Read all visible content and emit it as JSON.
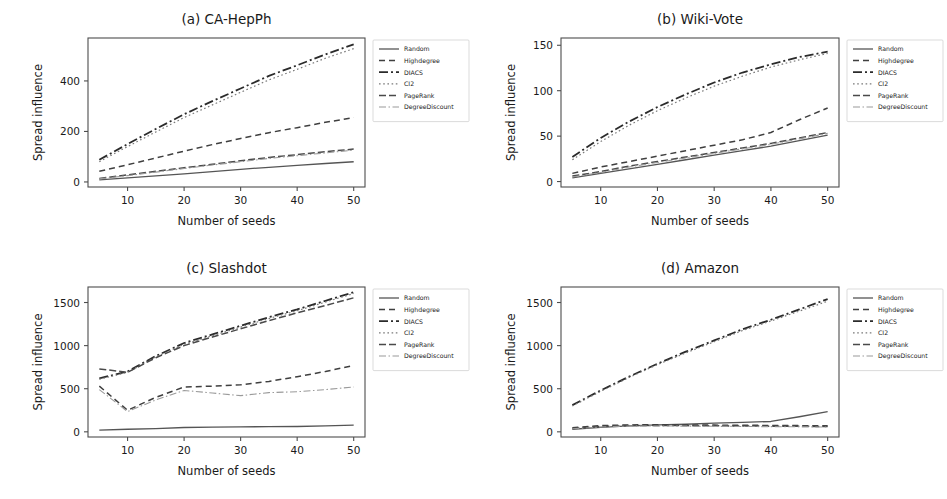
{
  "figure": {
    "background": "#ffffff",
    "axis_color": "#4d4d4d",
    "text_color": "#1a1a1a"
  },
  "series_styles": [
    {
      "key": "random",
      "label": "Random",
      "color": "#555555",
      "width": 1.3,
      "dash": "none"
    },
    {
      "key": "highdegree",
      "label": "Highdegree",
      "color": "#3f3f3f",
      "width": 1.5,
      "dash": "6,4"
    },
    {
      "key": "diacs",
      "label": "DIACS",
      "color": "#2b2b2b",
      "width": 1.8,
      "dash": "9,3,2,3"
    },
    {
      "key": "ci2",
      "label": "CI2",
      "color": "#7a7a7a",
      "width": 1.2,
      "dash": "1.6,2.6"
    },
    {
      "key": "pagerank",
      "label": "PageRank",
      "color": "#4a4a4a",
      "width": 1.5,
      "dash": "7,3"
    },
    {
      "key": "degreediscount",
      "label": "DegreeDiscount",
      "color": "#9a9a9a",
      "width": 1.1,
      "dash": "7,2.5,1.5,2.5"
    }
  ],
  "common": {
    "xlabel": "Number of seeds",
    "ylabel": "Spread influence",
    "xticks": [
      10,
      20,
      30,
      40,
      50
    ],
    "xlim": [
      3,
      52
    ],
    "legend_position": "right-outside",
    "grid": false
  },
  "chart_data": [
    {
      "type": "line",
      "panel": "a",
      "title": "(a) CA-HepPh",
      "xlabel": "Number of seeds",
      "ylabel": "Spread influence",
      "x": [
        5,
        10,
        15,
        20,
        25,
        30,
        35,
        40,
        45,
        50
      ],
      "xticks": [
        10,
        20,
        30,
        40,
        50
      ],
      "yticks": [
        0,
        200,
        400
      ],
      "xlim": [
        3,
        52
      ],
      "ylim": [
        -20,
        570
      ],
      "series": [
        {
          "name": "Random",
          "values": [
            8,
            16,
            24,
            32,
            41,
            50,
            58,
            66,
            73,
            80
          ]
        },
        {
          "name": "Highdegree",
          "values": [
            42,
            68,
            95,
            122,
            148,
            172,
            195,
            215,
            236,
            255
          ]
        },
        {
          "name": "DIACS",
          "values": [
            88,
            150,
            210,
            268,
            320,
            370,
            420,
            462,
            505,
            545
          ]
        },
        {
          "name": "CI2",
          "values": [
            80,
            140,
            198,
            255,
            305,
            355,
            404,
            446,
            490,
            528
          ]
        },
        {
          "name": "PageRank",
          "values": [
            14,
            28,
            42,
            56,
            70,
            84,
            97,
            108,
            120,
            130
          ]
        },
        {
          "name": "DegreeDiscount",
          "values": [
            12,
            25,
            39,
            53,
            67,
            80,
            93,
            104,
            115,
            126
          ]
        }
      ]
    },
    {
      "type": "line",
      "panel": "b",
      "title": "(b) Wiki-Vote",
      "xlabel": "Number of seeds",
      "ylabel": "Spread influence",
      "x": [
        5,
        10,
        15,
        20,
        25,
        30,
        35,
        40,
        45,
        50
      ],
      "xticks": [
        10,
        20,
        30,
        40,
        50
      ],
      "yticks": [
        0,
        50,
        100,
        150
      ],
      "xlim": [
        3,
        52
      ],
      "ylim": [
        -6,
        158
      ],
      "series": [
        {
          "name": "Random",
          "values": [
            4,
            9,
            14,
            19,
            24,
            29,
            34,
            39,
            45,
            51
          ]
        },
        {
          "name": "Highdegree",
          "values": [
            9,
            16,
            22,
            28,
            34,
            40,
            46,
            54,
            68,
            81
          ]
        },
        {
          "name": "DIACS",
          "values": [
            27,
            48,
            66,
            82,
            96,
            109,
            120,
            129,
            137,
            143
          ]
        },
        {
          "name": "CI2",
          "values": [
            24,
            44,
            62,
            78,
            92,
            105,
            116,
            126,
            134,
            141
          ]
        },
        {
          "name": "PageRank",
          "values": [
            6,
            11,
            17,
            22,
            27,
            32,
            37,
            42,
            48,
            54
          ]
        },
        {
          "name": "DegreeDiscount",
          "values": [
            5,
            10,
            16,
            21,
            26,
            31,
            36,
            41,
            47,
            53
          ]
        }
      ]
    },
    {
      "type": "line",
      "panel": "c",
      "title": "(c) Slashdot",
      "xlabel": "Number of seeds",
      "ylabel": "Spread influence",
      "x": [
        5,
        10,
        15,
        20,
        25,
        30,
        35,
        40,
        45,
        50
      ],
      "xticks": [
        10,
        20,
        30,
        40,
        50
      ],
      "yticks": [
        0,
        500,
        1000,
        1500
      ],
      "xlim": [
        3,
        52
      ],
      "ylim": [
        -60,
        1680
      ],
      "series": [
        {
          "name": "Random",
          "values": [
            20,
            30,
            38,
            50,
            55,
            58,
            60,
            62,
            68,
            78
          ]
        },
        {
          "name": "Highdegree",
          "values": [
            530,
            250,
            400,
            520,
            530,
            545,
            585,
            640,
            700,
            770
          ]
        },
        {
          "name": "DIACS",
          "values": [
            620,
            700,
            880,
            1030,
            1130,
            1230,
            1330,
            1420,
            1520,
            1620
          ]
        },
        {
          "name": "CI2",
          "values": [
            610,
            690,
            870,
            1015,
            1115,
            1215,
            1315,
            1405,
            1505,
            1605
          ]
        },
        {
          "name": "PageRank",
          "values": [
            730,
            690,
            860,
            1000,
            1100,
            1195,
            1290,
            1380,
            1465,
            1555
          ]
        },
        {
          "name": "DegreeDiscount",
          "values": [
            490,
            235,
            370,
            480,
            450,
            420,
            455,
            465,
            490,
            520
          ]
        }
      ]
    },
    {
      "type": "line",
      "panel": "d",
      "title": "(d) Amazon",
      "xlabel": "Number of seeds",
      "ylabel": "Spread influence",
      "x": [
        5,
        10,
        15,
        20,
        25,
        30,
        35,
        40,
        45,
        50
      ],
      "xticks": [
        10,
        20,
        30,
        40,
        50
      ],
      "yticks": [
        0,
        500,
        1000,
        1500
      ],
      "xlim": [
        3,
        52
      ],
      "ylim": [
        -60,
        1680
      ],
      "series": [
        {
          "name": "Random",
          "values": [
            30,
            52,
            70,
            80,
            88,
            100,
            110,
            120,
            175,
            235
          ]
        },
        {
          "name": "Highdegree",
          "values": [
            48,
            72,
            80,
            82,
            80,
            78,
            76,
            74,
            72,
            70
          ]
        },
        {
          "name": "DIACS",
          "values": [
            310,
            480,
            640,
            790,
            930,
            1060,
            1190,
            1300,
            1420,
            1540
          ]
        },
        {
          "name": "CI2",
          "values": [
            300,
            470,
            630,
            780,
            915,
            1045,
            1175,
            1285,
            1400,
            1515
          ]
        },
        {
          "name": "PageRank",
          "values": [
            40,
            62,
            72,
            74,
            72,
            70,
            68,
            66,
            64,
            62
          ]
        },
        {
          "name": "DegreeDiscount",
          "values": [
            35,
            56,
            66,
            68,
            66,
            64,
            62,
            60,
            58,
            56
          ]
        }
      ]
    }
  ]
}
